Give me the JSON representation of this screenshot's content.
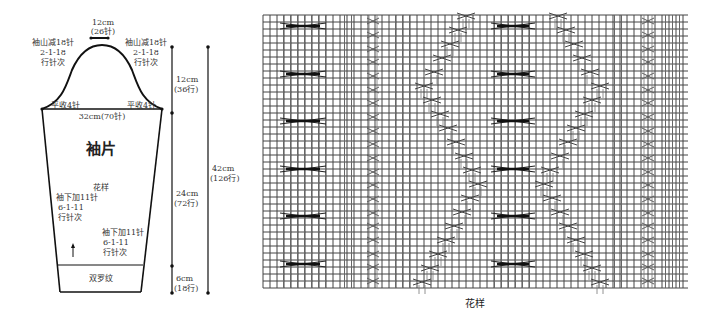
{
  "sleeve": {
    "piece_name": "袖片",
    "top_width": {
      "cm": "12cm",
      "stitches": "(26针)"
    },
    "cap_left": {
      "line1": "袖山减18针",
      "line2": "2-1-18",
      "line3": "行针次"
    },
    "cap_right": {
      "line1": "袖山减18针",
      "line2": "2-1-18",
      "line3": "行针次"
    },
    "bind_off_left": "平收4针",
    "bind_off_right": "平收4针",
    "width": "32cm(70针)",
    "pattern_label": "花样",
    "increase_left": {
      "line1": "袖下加11针",
      "line2": "6-1-11",
      "line3": "行针次"
    },
    "increase_right": {
      "line1": "袖下加11针",
      "line2": "6-1-11",
      "line3": "行针次"
    },
    "ribbing": "双罗纹",
    "direction": "up-arrow"
  },
  "measurements": {
    "cap": {
      "cm": "12cm",
      "rows": "(36行)"
    },
    "body": {
      "cm": "24cm",
      "rows": "(72行)"
    },
    "cuff": {
      "cm": "6cm",
      "rows": "(18行)"
    },
    "total": {
      "cm": "42cm",
      "rows": "(126行)"
    }
  },
  "chart": {
    "title": "花样",
    "grid": {
      "left": 263,
      "top": 15,
      "right": 688,
      "bottom": 288,
      "cell_w": 7,
      "cell_h": 7
    },
    "rib_groups": [
      {
        "x0": 280,
        "x1": 326
      },
      {
        "x0": 341,
        "x1": 357
      },
      {
        "x0": 392,
        "x1": 410
      },
      {
        "x0": 491,
        "x1": 535
      },
      {
        "x0": 611,
        "x1": 628
      },
      {
        "x0": 662,
        "x1": 680
      }
    ],
    "big_cables": {
      "x_groups": [
        [
          280,
          326
        ],
        [
          491,
          535
        ]
      ],
      "rows_y": [
        26,
        74,
        121,
        169,
        216,
        264
      ]
    },
    "small_cable_columns": [
      373,
      648
    ],
    "small_cable_rows_y": [
      21,
      35,
      49,
      62,
      76,
      90,
      103,
      117,
      131,
      144,
      158,
      172,
      185,
      199,
      213,
      226,
      240,
      254,
      267,
      281
    ],
    "traveling_cable_a": [
      [
        466,
        16
      ],
      [
        458,
        30
      ],
      [
        450,
        44
      ],
      [
        442,
        58
      ],
      [
        434,
        72
      ],
      [
        424,
        86
      ],
      [
        432,
        100
      ],
      [
        440,
        114
      ],
      [
        448,
        128
      ],
      [
        456,
        142
      ],
      [
        464,
        156
      ],
      [
        472,
        170
      ],
      [
        478,
        184
      ],
      [
        470,
        198
      ],
      [
        462,
        212
      ],
      [
        454,
        226
      ],
      [
        446,
        240
      ],
      [
        438,
        254
      ],
      [
        430,
        268
      ],
      [
        422,
        282
      ]
    ],
    "traveling_cable_b": [
      [
        558,
        16
      ],
      [
        566,
        30
      ],
      [
        574,
        44
      ],
      [
        582,
        58
      ],
      [
        590,
        72
      ],
      [
        600,
        86
      ],
      [
        592,
        100
      ],
      [
        584,
        114
      ],
      [
        576,
        128
      ],
      [
        568,
        142
      ],
      [
        560,
        156
      ],
      [
        550,
        170
      ],
      [
        544,
        184
      ],
      [
        552,
        198
      ],
      [
        560,
        212
      ],
      [
        568,
        226
      ],
      [
        576,
        240
      ],
      [
        584,
        254
      ],
      [
        592,
        268
      ],
      [
        600,
        282
      ]
    ]
  }
}
